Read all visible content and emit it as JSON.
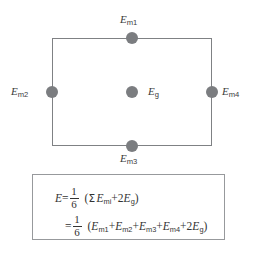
{
  "figure": {
    "type": "geometry-diagram-with-formula",
    "shape": {
      "name": "rectangle",
      "stroke_color": "#7f8184"
    },
    "node_color": "#7b7d80",
    "nodes": [
      {
        "id": "m1",
        "label_var": "E",
        "label_sub": "m1",
        "position": "top-midpoint"
      },
      {
        "id": "m2",
        "label_var": "E",
        "label_sub": "m2",
        "position": "left-midpoint"
      },
      {
        "id": "m3",
        "label_var": "E",
        "label_sub": "m3",
        "position": "bottom-midpoint"
      },
      {
        "id": "m4",
        "label_var": "E",
        "label_sub": "m4",
        "position": "right-midpoint"
      },
      {
        "id": "g",
        "label_var": "E",
        "label_sub": "g",
        "position": "center"
      }
    ],
    "formula": {
      "border_color": "#97999c",
      "line1": {
        "lhs_var": "E",
        "equals": "=",
        "fraction_numerator": "1",
        "fraction_denominator": "6",
        "open_paren": "(",
        "sigma": "Σ",
        "sum_term_var": "E",
        "sum_term_sub": "mi",
        "plus": "+",
        "g_coefficient": "2",
        "g_var": "E",
        "g_sub": "g",
        "close_paren": ")"
      },
      "line2": {
        "equals": "=",
        "fraction_numerator": "1",
        "fraction_denominator": "6",
        "open_paren": "(",
        "t1_var": "E",
        "t1_sub": "m1",
        "p1": "+",
        "t2_var": "E",
        "t2_sub": "m2",
        "p2": "+",
        "t3_var": "E",
        "t3_sub": "m3",
        "p3": "+",
        "t4_var": "E",
        "t4_sub": "m4",
        "p4": "+",
        "g_coefficient": "2",
        "g_var": "E",
        "g_sub": "g",
        "close_paren": ")"
      }
    }
  }
}
